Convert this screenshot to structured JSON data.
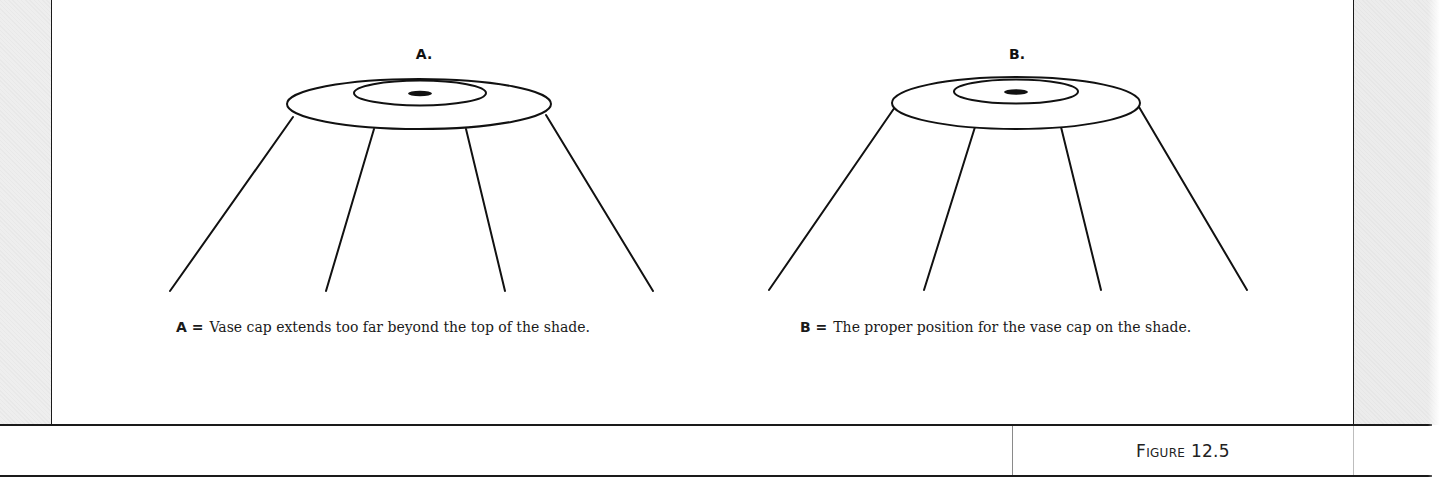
{
  "figure": {
    "number_label": "Figure 12.5",
    "number_prefix": "Figure",
    "number_value": "12.5"
  },
  "panels": [
    {
      "id": "A",
      "letter": "A.",
      "caption_key": "A =",
      "caption_text": "Vase cap extends too far beyond the top of the shade.",
      "description": "Vase cap ellipse wider than the shade top; shade ribs start inside the cap outline."
    },
    {
      "id": "B",
      "letter": "B.",
      "caption_key": "B =",
      "caption_text": "The proper position for the vase cap on the shade.",
      "description": "Vase cap ellipse matches the top of the shade; shade ribs start at the cap's edge."
    }
  ],
  "colors": {
    "ink": "#111111",
    "margin_gray": "#eeeeee",
    "background": "#ffffff"
  }
}
